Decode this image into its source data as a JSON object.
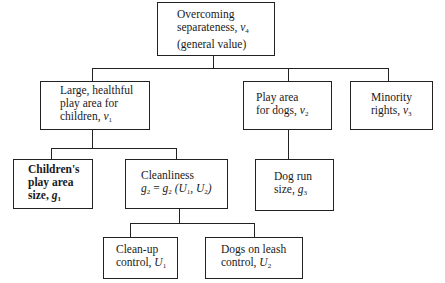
{
  "diagram": {
    "type": "value-hierarchy-tree",
    "nodes": [
      {
        "id": "v4",
        "lines": [
          "Overcoming",
          "separateness, v4",
          "(general value)"
        ],
        "symbol": "v",
        "sub": "4",
        "level": 0
      },
      {
        "id": "v1",
        "lines": [
          "Large, healthful",
          "play area for",
          "children, v1"
        ],
        "symbol": "v",
        "sub": "1",
        "level": 1,
        "parent": "v4"
      },
      {
        "id": "v2",
        "lines": [
          "Play area",
          "for dogs, v2"
        ],
        "symbol": "v",
        "sub": "2",
        "level": 1,
        "parent": "v4"
      },
      {
        "id": "v3",
        "lines": [
          "Minority",
          "rights, v3"
        ],
        "symbol": "v",
        "sub": "3",
        "level": 1,
        "parent": "v4"
      },
      {
        "id": "g1",
        "lines": [
          "Children's",
          "play area",
          "size, g1"
        ],
        "symbol": "g",
        "sub": "1",
        "level": 2,
        "parent": "v1"
      },
      {
        "id": "g2",
        "lines": [
          "Cleanliness",
          "g2 = g2 (U1, U2)"
        ],
        "level": 2,
        "parent": "v1"
      },
      {
        "id": "g3",
        "lines": [
          "Dog run",
          "size, g3"
        ],
        "symbol": "g",
        "sub": "3",
        "level": 2,
        "parent": "v2"
      },
      {
        "id": "U1",
        "lines": [
          "Clean-up",
          "control, U1"
        ],
        "symbol": "U",
        "sub": "1",
        "level": 3,
        "parent": "g2"
      },
      {
        "id": "U2",
        "lines": [
          "Dogs on leash",
          "control, U2"
        ],
        "symbol": "U",
        "sub": "2",
        "level": 3,
        "parent": "g2"
      }
    ],
    "labels": {
      "v4_l1": "Overcoming",
      "v4_l2": "separateness, ",
      "v4_l3": "(general value)",
      "v1_l1": "Large, healthful",
      "v1_l2": "play area for",
      "v1_l3": "children, ",
      "v2_l1": "Play area",
      "v2_l2": "for dogs, ",
      "v3_l1": "Minority",
      "v3_l2": "rights, ",
      "g1_l1": "Children's",
      "g1_l2": "play area",
      "g1_l3": "size, ",
      "g2_l1": "Cleanliness",
      "g3_l1": "Dog run",
      "g3_l2": "size, ",
      "U1_l1": "Clean-up",
      "U1_l2": "control, ",
      "U2_l1": "Dogs on leash",
      "U2_l2": "control, "
    },
    "symbols": {
      "v": "v",
      "g": "g",
      "U": "U",
      "eq": " = ",
      "open": " (",
      "comma": ", ",
      "close": ")",
      "s1": "1",
      "s2": "2",
      "s3": "3",
      "s4": "4"
    }
  }
}
